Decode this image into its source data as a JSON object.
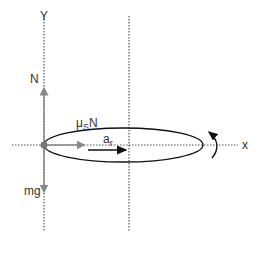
{
  "diagram": {
    "axes": {
      "y_label": "Y",
      "x_label": "x"
    },
    "forces": {
      "normal": {
        "label": "N",
        "direction": "up"
      },
      "weight": {
        "label": "mg",
        "direction": "down"
      },
      "friction": {
        "label_main": "μ",
        "label_sub": "S",
        "label_tail": "N",
        "direction": "right"
      }
    },
    "acceleration": {
      "label_main": "a",
      "label_sub": "r"
    },
    "rotation": {
      "direction": "counterclockwise"
    },
    "colors": {
      "axis": "#555555",
      "force_arrow": "#888888",
      "ellipse": "#111111",
      "accel_arrow": "#111111",
      "origin_dot": "#777777"
    }
  }
}
